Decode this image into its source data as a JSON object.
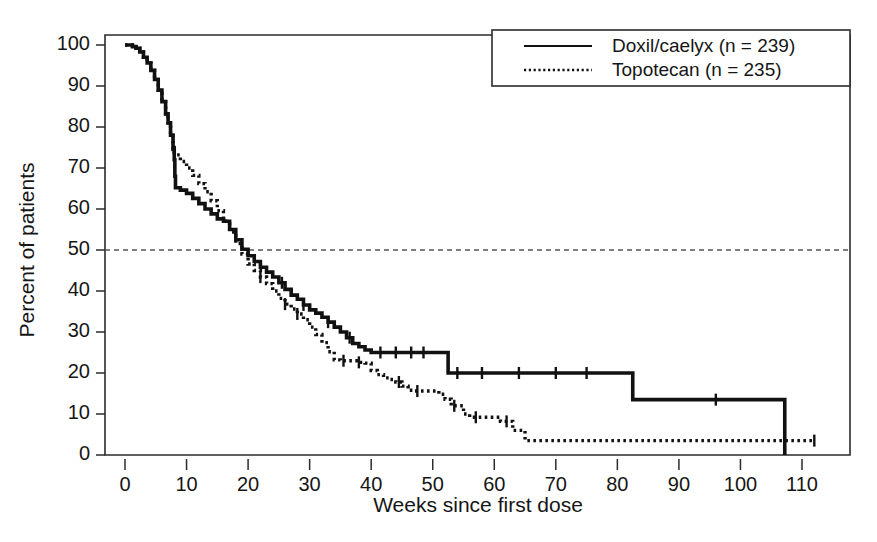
{
  "chart_data": {
    "type": "line",
    "title": "",
    "xlabel": "Weeks since first dose",
    "ylabel": "Percent of patients",
    "xlim": [
      0,
      114
    ],
    "ylim": [
      0,
      104
    ],
    "xticks": [
      0,
      10,
      20,
      30,
      40,
      50,
      60,
      70,
      80,
      90,
      100,
      110
    ],
    "xticklabels": [
      "0",
      "10",
      "20",
      "30",
      "40",
      "50",
      "60",
      "70",
      "80",
      "90",
      "100",
      "110"
    ],
    "yticks": [
      0,
      10,
      20,
      30,
      40,
      50,
      60,
      70,
      80,
      90,
      100
    ],
    "yticklabels": [
      "0",
      "10",
      "20",
      "30",
      "40",
      "50",
      "60",
      "70",
      "80",
      "90",
      "100"
    ],
    "grid": false,
    "legend_position": "top-right",
    "reference_lines": [
      {
        "name": "median-50-percent",
        "axis": "y",
        "value": 50,
        "style": "dashed"
      }
    ],
    "series": [
      {
        "name": "Doxil/caelyx (n = 239)",
        "label": "Doxil/caelyx",
        "n": 239,
        "style": "solid",
        "color": "#111111",
        "points": [
          [
            0,
            100
          ],
          [
            0.6,
            100
          ],
          [
            1.2,
            99.6
          ],
          [
            1.8,
            99.2
          ],
          [
            2.4,
            98.3
          ],
          [
            3.0,
            97.0
          ],
          [
            3.6,
            95.6
          ],
          [
            4.2,
            93.8
          ],
          [
            4.8,
            91.6
          ],
          [
            5.4,
            89.0
          ],
          [
            6.0,
            86.2
          ],
          [
            6.6,
            83.2
          ],
          [
            7.0,
            81.0
          ],
          [
            7.4,
            78.0
          ],
          [
            7.8,
            74.5
          ],
          [
            8.0,
            72.0
          ],
          [
            8.1,
            68.0
          ],
          [
            8.2,
            65.2
          ],
          [
            9.0,
            64.6
          ],
          [
            10.0,
            63.8
          ],
          [
            11.0,
            62.6
          ],
          [
            12.0,
            61.3
          ],
          [
            13.0,
            60.0
          ],
          [
            14.0,
            58.8
          ],
          [
            15.0,
            57.6
          ],
          [
            16.0,
            57.0
          ],
          [
            17.0,
            55.0
          ],
          [
            18.0,
            52.5
          ],
          [
            19.0,
            50.2
          ],
          [
            20.0,
            48.6
          ],
          [
            21.0,
            47.2
          ],
          [
            22.0,
            45.8
          ],
          [
            23.0,
            44.6
          ],
          [
            24.0,
            43.4
          ],
          [
            25.0,
            42.0
          ],
          [
            26.0,
            40.4
          ],
          [
            27.0,
            39.0
          ],
          [
            28.0,
            38.0
          ],
          [
            29.0,
            36.6
          ],
          [
            30.0,
            35.4
          ],
          [
            31.0,
            34.6
          ],
          [
            32.0,
            33.6
          ],
          [
            33.0,
            32.4
          ],
          [
            34.0,
            31.2
          ],
          [
            35.0,
            30.0
          ],
          [
            36.0,
            28.6
          ],
          [
            37.0,
            27.2
          ],
          [
            38.0,
            26.4
          ],
          [
            39.0,
            25.6
          ],
          [
            40.0,
            25.0
          ],
          [
            52.0,
            25.0
          ],
          [
            52.5,
            20.0
          ],
          [
            82.0,
            20.0
          ],
          [
            82.5,
            13.5
          ],
          [
            107.0,
            13.5
          ],
          [
            107.2,
            0
          ]
        ],
        "censor_points": [
          [
            25.5,
            42.0
          ],
          [
            29.0,
            36.6
          ],
          [
            33.0,
            32.4
          ],
          [
            36.5,
            28.6
          ],
          [
            41.5,
            25.0
          ],
          [
            44.0,
            25.0
          ],
          [
            46.5,
            25.0
          ],
          [
            48.5,
            25.0
          ],
          [
            54.0,
            20.0
          ],
          [
            58.0,
            20.0
          ],
          [
            64.0,
            20.0
          ],
          [
            70.0,
            20.0
          ],
          [
            75.0,
            20.0
          ],
          [
            96.0,
            13.5
          ]
        ]
      },
      {
        "name": "Topotecan (n = 235)",
        "label": "Topotecan",
        "n": 235,
        "style": "dotted",
        "color": "#111111",
        "points": [
          [
            0,
            100
          ],
          [
            0.6,
            100
          ],
          [
            1.2,
            99.6
          ],
          [
            1.8,
            99.2
          ],
          [
            2.4,
            98.3
          ],
          [
            3.0,
            97.0
          ],
          [
            3.6,
            95.6
          ],
          [
            4.2,
            93.8
          ],
          [
            4.8,
            91.6
          ],
          [
            5.4,
            89.0
          ],
          [
            6.0,
            86.2
          ],
          [
            6.6,
            83.2
          ],
          [
            7.0,
            81.0
          ],
          [
            7.4,
            78.0
          ],
          [
            7.8,
            75.0
          ],
          [
            8.0,
            73.2
          ],
          [
            9.0,
            71.6
          ],
          [
            10.0,
            70.0
          ],
          [
            11.0,
            68.2
          ],
          [
            12.0,
            66.2
          ],
          [
            13.0,
            64.2
          ],
          [
            14.0,
            62.0
          ],
          [
            15.0,
            59.6
          ],
          [
            16.0,
            57.0
          ],
          [
            17.0,
            54.4
          ],
          [
            18.0,
            51.6
          ],
          [
            19.0,
            49.0
          ],
          [
            20.0,
            46.6
          ],
          [
            21.0,
            45.0
          ],
          [
            22.0,
            43.4
          ],
          [
            23.0,
            41.8
          ],
          [
            24.0,
            40.0
          ],
          [
            25.0,
            38.2
          ],
          [
            26.0,
            36.8
          ],
          [
            27.0,
            35.6
          ],
          [
            28.0,
            34.4
          ],
          [
            29.0,
            33.0
          ],
          [
            30.0,
            31.2
          ],
          [
            31.0,
            29.4
          ],
          [
            32.0,
            27.4
          ],
          [
            33.0,
            25.2
          ],
          [
            34.0,
            23.2
          ],
          [
            35.0,
            23.0
          ],
          [
            37.0,
            23.0
          ],
          [
            38.0,
            22.6
          ],
          [
            39.0,
            22.4
          ],
          [
            40.0,
            20.6
          ],
          [
            41.0,
            19.6
          ],
          [
            42.0,
            18.8
          ],
          [
            43.0,
            18.4
          ],
          [
            44.0,
            17.8
          ],
          [
            45.0,
            16.8
          ],
          [
            46.0,
            15.8
          ],
          [
            47.0,
            15.6
          ],
          [
            50.0,
            15.6
          ],
          [
            51.0,
            14.8
          ],
          [
            52.0,
            13.6
          ],
          [
            53.0,
            12.0
          ],
          [
            55.0,
            10.0
          ],
          [
            56.0,
            9.2
          ],
          [
            60.0,
            9.2
          ],
          [
            61.0,
            8.2
          ],
          [
            63.0,
            6.0
          ],
          [
            65.0,
            3.5
          ],
          [
            112.0,
            3.5
          ]
        ],
        "censor_points": [
          [
            22.0,
            43.4
          ],
          [
            26.0,
            36.8
          ],
          [
            28.0,
            34.4
          ],
          [
            35.5,
            23.0
          ],
          [
            38.0,
            22.6
          ],
          [
            44.5,
            17.8
          ],
          [
            47.5,
            15.6
          ],
          [
            53.5,
            12.0
          ],
          [
            57.0,
            9.2
          ],
          [
            62.0,
            8.2
          ],
          [
            112.0,
            3.5
          ]
        ]
      }
    ]
  },
  "legend": {
    "entries": [
      {
        "label": "Doxil/caelyx (n = 239)",
        "style": "solid"
      },
      {
        "label": "Topotecan (n = 235)",
        "style": "dotted"
      }
    ]
  },
  "axes": {
    "x_title": "Weeks since first dose",
    "y_title": "Percent of patients"
  }
}
